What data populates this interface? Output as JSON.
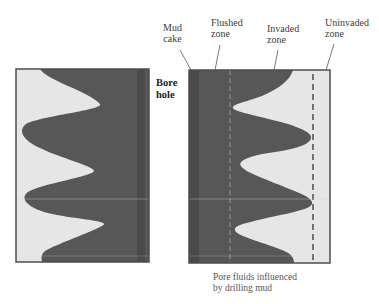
{
  "labels": {
    "mud_cake": [
      "Mud",
      "cake"
    ],
    "flushed_zone": [
      "Flushed",
      "zone"
    ],
    "invaded_zone": [
      "Invaded",
      "zone"
    ],
    "uninvaded_zone": [
      "Uninvaded",
      "zone"
    ],
    "bore_hole": [
      "Bore",
      "hole"
    ],
    "caption": [
      "Pore fluids influenced",
      "by drilling mud"
    ]
  },
  "colors": {
    "dark_fill": "#575757",
    "dark_strip": "#4a4a4a",
    "light_fill": "#e6e6e6",
    "border": "#4d4d4d",
    "flushed_boundary_dash": "#9a9a9a",
    "invaded_boundary_dash": "#555555"
  }
}
